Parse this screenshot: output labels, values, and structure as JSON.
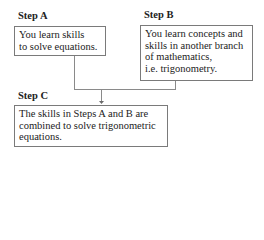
{
  "steps": {
    "a": {
      "label": "Step A",
      "lines": [
        "You learn skills",
        "to solve equations."
      ]
    },
    "b": {
      "label": "Step B",
      "lines": [
        "You learn concepts and",
        "skills in another branch",
        "of mathematics,",
        "i.e. trigonometry."
      ]
    },
    "c": {
      "label": "Step C",
      "lines": [
        "The skills in Steps A and B are",
        "combined to solve trigonometric",
        "equations."
      ]
    }
  },
  "connectors": [
    {
      "from": "Step A",
      "to": "Step C"
    },
    {
      "from": "Step B",
      "to": "Step C"
    }
  ]
}
